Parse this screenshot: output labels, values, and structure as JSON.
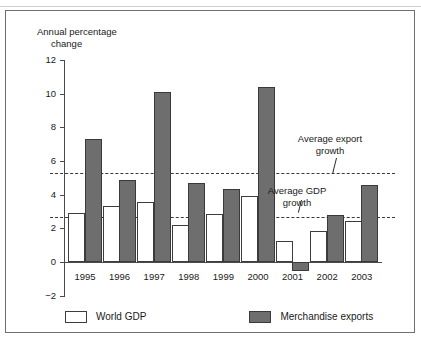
{
  "chart_data": {
    "type": "bar",
    "title": "",
    "subtitle": "",
    "ylabel_line1": "Annual percentage",
    "ylabel_line2": "change",
    "xlabel": "",
    "categories": [
      "1995",
      "1996",
      "1997",
      "1998",
      "1999",
      "2000",
      "2001",
      "2002",
      "2003"
    ],
    "series": [
      {
        "name": "World GDP",
        "color": "#ffffff",
        "values": [
          2.9,
          3.3,
          3.55,
          2.2,
          2.85,
          3.95,
          1.25,
          1.85,
          2.45
        ]
      },
      {
        "name": "Merchandise exports",
        "color": "#6e6e6e",
        "values": [
          7.3,
          4.85,
          10.1,
          4.7,
          4.35,
          10.4,
          -0.55,
          2.8,
          4.55
        ]
      }
    ],
    "reference_lines": [
      {
        "id": "average-export-growth",
        "label_line1": "Average export",
        "label_line2": "growth",
        "value": 5.3,
        "style": "dashed"
      },
      {
        "id": "average-gdp-growth",
        "label_line1": "Average GDP",
        "label_line2": "growth",
        "value": 2.65,
        "style": "dashed"
      }
    ],
    "yticks": [
      12,
      10,
      8,
      6,
      4,
      2,
      0,
      -2
    ],
    "ytick_labels": [
      "12",
      "10",
      "8",
      "6",
      "4",
      "2",
      "0",
      "−2"
    ],
    "ylim": [
      -2,
      12
    ],
    "grid": false,
    "legend_position": "bottom"
  },
  "legend": {
    "items": [
      {
        "label": "World GDP",
        "swatch": "white-square-swatch"
      },
      {
        "label": "Merchandise exports",
        "swatch": "gray-square-swatch"
      }
    ]
  },
  "colors": {
    "exports_fill": "#6e6e6e",
    "gdp_fill": "#ffffff",
    "outline": "#3a3a3a",
    "axis": "#4a4a4a",
    "frame": "#6f6f6f"
  }
}
